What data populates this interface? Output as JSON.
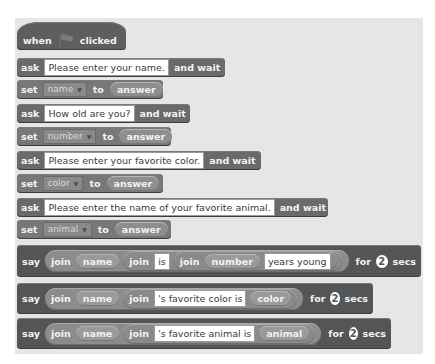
{
  "script": {
    "hat": {
      "when": "when",
      "flag_icon": "green-flag-icon",
      "clicked": "clicked"
    },
    "blocks": [
      {
        "type": "ask",
        "keyword": "ask",
        "text": "Please enter your name.",
        "suffix": "and wait"
      },
      {
        "type": "set",
        "keyword": "set",
        "variable": "name",
        "to": "to",
        "value": "answer"
      },
      {
        "type": "ask",
        "keyword": "ask",
        "text": "How old are you?",
        "suffix": "and wait"
      },
      {
        "type": "set",
        "keyword": "set",
        "variable": "number",
        "to": "to",
        "value": "answer"
      },
      {
        "type": "ask",
        "keyword": "ask",
        "text": "Please enter your favorite color.",
        "suffix": "and wait"
      },
      {
        "type": "set",
        "keyword": "set",
        "variable": "color",
        "to": "to",
        "value": "answer"
      },
      {
        "type": "ask",
        "keyword": "ask",
        "text": "Please enter the name of your favorite animal.",
        "suffix": "and wait"
      },
      {
        "type": "set",
        "keyword": "set",
        "variable": "animal",
        "to": "to",
        "value": "answer"
      }
    ],
    "say_blocks": [
      {
        "keyword": "say",
        "join": "join",
        "var1": "name",
        "inner_join": "join",
        "text1": "is",
        "inner_join2": "join",
        "var2": "number",
        "text2": "years young",
        "for": "for",
        "secs_value": "2",
        "secs": "secs"
      },
      {
        "keyword": "say",
        "join": "join",
        "var1": "name",
        "inner_join": "join",
        "text1": "'s favorite color is",
        "var2": "color",
        "for": "for",
        "secs_value": "2",
        "secs": "secs"
      },
      {
        "keyword": "say",
        "join": "join",
        "var1": "name",
        "inner_join": "join",
        "text1": "'s favorite animal is",
        "var2": "animal",
        "for": "for",
        "secs_value": "2",
        "secs": "secs"
      }
    ]
  }
}
